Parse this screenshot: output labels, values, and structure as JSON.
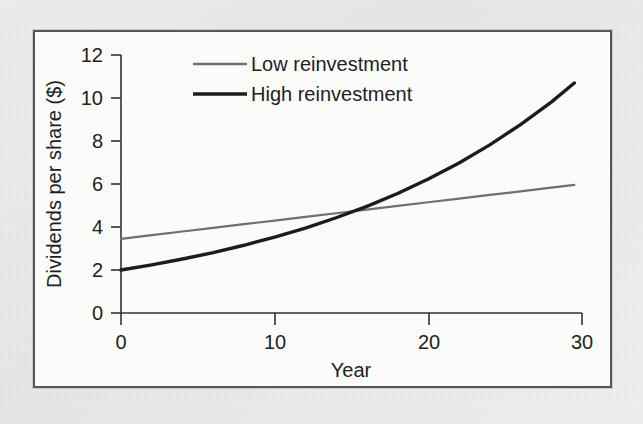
{
  "figure": {
    "frame_color": "#55555a",
    "plot_background": "#fbfbfa",
    "page_background": "#e9e9e7"
  },
  "bleed_through_text": "reduced in the contained gain the example of the in all with the years of a was the higher of the in to capital in the to an the high 52 to the and in of the to of the",
  "chart_data": {
    "type": "line",
    "title": "",
    "subtitle": "",
    "xlabel": "Year",
    "ylabel": "Dividends per share ($)",
    "xlim": [
      0,
      30
    ],
    "ylim": [
      0,
      12
    ],
    "xticks": [
      0,
      10,
      20,
      30
    ],
    "xtick_labels": [
      "0",
      "10",
      "20",
      "30"
    ],
    "yticks": [
      0,
      2,
      4,
      6,
      8,
      10,
      12
    ],
    "ytick_labels": [
      "0",
      "2",
      "4",
      "6",
      "8",
      "10",
      "12"
    ],
    "grid": false,
    "legend_position": "upper center",
    "annotations": [],
    "x": [
      0,
      2,
      4,
      6,
      8,
      10,
      12,
      14,
      16,
      18,
      20,
      22,
      24,
      26,
      28,
      29.5
    ],
    "series": [
      {
        "name": "Low reinvestment",
        "color": "#6f6f6f",
        "line_width": 2.2,
        "shape": "linear",
        "values": [
          3.45,
          3.62,
          3.79,
          3.96,
          4.13,
          4.3,
          4.47,
          4.64,
          4.81,
          4.98,
          5.15,
          5.32,
          5.49,
          5.66,
          5.83,
          5.96
        ]
      },
      {
        "name": "High reinvestment",
        "color": "#1c1c1c",
        "line_width": 3.4,
        "shape": "exponential",
        "values": [
          2.0,
          2.24,
          2.51,
          2.81,
          3.15,
          3.53,
          3.95,
          4.43,
          4.96,
          5.56,
          6.23,
          6.98,
          7.82,
          8.76,
          9.81,
          10.7
        ]
      }
    ],
    "crossover": {
      "year": 13.5,
      "value": 4.4
    }
  },
  "legend": {
    "entries": [
      {
        "label": "Low reinvestment",
        "color": "#6f6f6f"
      },
      {
        "label": "High reinvestment",
        "color": "#1c1c1c"
      }
    ]
  }
}
